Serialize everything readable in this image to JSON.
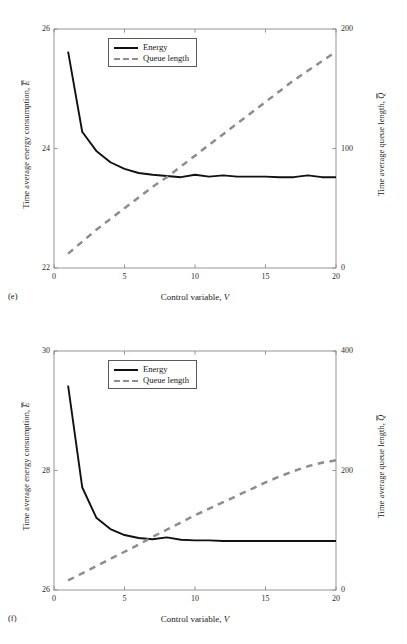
{
  "figure": {
    "panels": [
      {
        "tag": "(e)",
        "xlabel_text": "Control variable, ",
        "xlabel_sym": "V",
        "ylabel_left_text": "Time average energy consumption, ",
        "ylabel_left_sym": "E",
        "ylabel_right_text": "Time average queue length, ",
        "ylabel_right_sym": "Q",
        "legend": [
          {
            "label": "Energy",
            "style": "solid",
            "color": "#111111"
          },
          {
            "label": "Queue length",
            "style": "dashed",
            "color": "#8d8d8d"
          }
        ],
        "xticks": [
          "0",
          "5",
          "10",
          "15",
          "20"
        ],
        "yticks_left": [
          "26",
          "24",
          "22"
        ],
        "yticks_right": [
          "200",
          "100",
          "0"
        ]
      },
      {
        "tag": "(f)",
        "xlabel_text": "Control variable, ",
        "xlabel_sym": "V",
        "ylabel_left_text": "Time average energy consumption, ",
        "ylabel_left_sym": "E",
        "ylabel_right_text": "Time average queue length, ",
        "ylabel_right_sym": "Q",
        "legend": [
          {
            "label": "Energy",
            "style": "solid",
            "color": "#111111"
          },
          {
            "label": "Queue length",
            "style": "dashed",
            "color": "#8d8d8d"
          }
        ],
        "xticks": [
          "0",
          "5",
          "10",
          "15",
          "20"
        ],
        "yticks_left": [
          "30",
          "28",
          "26"
        ],
        "yticks_right": [
          "400",
          "200",
          "0"
        ]
      }
    ]
  },
  "chart_data": [
    {
      "type": "line",
      "panel": "(e)",
      "title": "",
      "xlabel": "Control variable, V",
      "ylabel": "Time average energy consumption, Ē",
      "y2label": "Time average queue length, Q̄",
      "xlim": [
        0,
        20
      ],
      "ylim": [
        22,
        26
      ],
      "y2lim": [
        0,
        200
      ],
      "xticks": [
        0,
        5,
        10,
        15,
        20
      ],
      "yticks": [
        22,
        24,
        26
      ],
      "y2ticks": [
        0,
        100,
        200
      ],
      "grid": false,
      "legend_position": "upper center",
      "series": [
        {
          "name": "Energy",
          "axis": "left",
          "style": "solid",
          "color": "#111111",
          "x": [
            1,
            2,
            3,
            4,
            5,
            6,
            7,
            8,
            9,
            10,
            11,
            12,
            13,
            14,
            15,
            16,
            17,
            18,
            19,
            20
          ],
          "values": [
            25.62,
            24.28,
            23.96,
            23.77,
            23.66,
            23.59,
            23.56,
            23.54,
            23.52,
            23.56,
            23.53,
            23.55,
            23.53,
            23.53,
            23.53,
            23.52,
            23.52,
            23.55,
            23.52,
            23.52
          ]
        },
        {
          "name": "Queue length",
          "axis": "right",
          "style": "dashed",
          "color": "#8d8d8d",
          "x": [
            1,
            2,
            3,
            4,
            5,
            6,
            7,
            8,
            9,
            10,
            11,
            12,
            13,
            14,
            15,
            16,
            17,
            18,
            19,
            20
          ],
          "values": [
            12,
            22,
            32,
            41,
            50,
            59,
            68,
            76,
            85,
            94,
            103,
            112,
            121,
            130,
            139,
            148,
            157,
            165,
            173,
            181
          ]
        }
      ]
    },
    {
      "type": "line",
      "panel": "(f)",
      "title": "",
      "xlabel": "Control variable, V",
      "ylabel": "Time average energy consumption, Ē",
      "y2label": "Time average queue length, Q̄",
      "xlim": [
        0,
        20
      ],
      "ylim": [
        26,
        30
      ],
      "y2lim": [
        0,
        400
      ],
      "xticks": [
        0,
        5,
        10,
        15,
        20
      ],
      "yticks": [
        26,
        28,
        30
      ],
      "y2ticks": [
        0,
        200,
        400
      ],
      "grid": false,
      "legend_position": "upper center",
      "series": [
        {
          "name": "Energy",
          "axis": "left",
          "style": "solid",
          "color": "#111111",
          "x": [
            1,
            2,
            3,
            4,
            5,
            6,
            7,
            8,
            9,
            10,
            11,
            12,
            13,
            14,
            15,
            16,
            17,
            18,
            19,
            20
          ],
          "values": [
            29.42,
            27.72,
            27.21,
            27.02,
            26.92,
            26.87,
            26.85,
            26.88,
            26.84,
            26.83,
            26.83,
            26.82,
            26.82,
            26.82,
            26.82,
            26.82,
            26.82,
            26.82,
            26.82,
            26.82
          ]
        },
        {
          "name": "Queue length",
          "axis": "right",
          "style": "dashed",
          "color": "#8d8d8d",
          "x": [
            1,
            2,
            3,
            4,
            5,
            6,
            7,
            8,
            9,
            10,
            11,
            12,
            13,
            14,
            15,
            16,
            17,
            18,
            19,
            20
          ],
          "values": [
            16,
            28,
            40,
            52,
            64,
            76,
            89,
            101,
            113,
            125,
            136,
            147,
            158,
            169,
            180,
            190,
            199,
            207,
            213,
            217
          ]
        }
      ]
    }
  ]
}
